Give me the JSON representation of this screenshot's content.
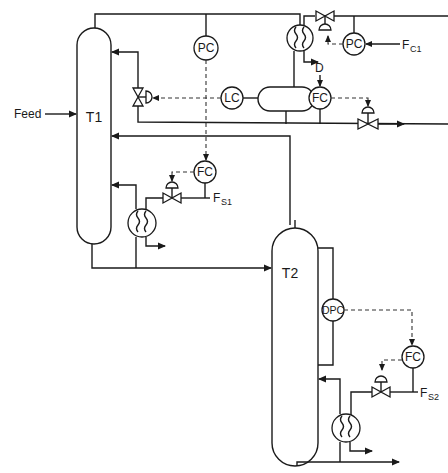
{
  "diagram": {
    "type": "process-control-flowsheet",
    "columns": [
      {
        "id": "T1",
        "label": "T1"
      },
      {
        "id": "T2",
        "label": "T2"
      }
    ],
    "streams": {
      "feed": "Feed",
      "distillate": "D",
      "coolant_1_main": "F",
      "coolant_1_sub": "C1",
      "steam_1_main": "F",
      "steam_1_sub": "S1",
      "steam_2_main": "F",
      "steam_2_sub": "S2"
    },
    "controllers": {
      "pc_column": "PC",
      "pc_condenser": "PC",
      "lc_drum": "LC",
      "fc_distillate": "FC",
      "fc_reboiler1": "FC",
      "dpc_column2": "DPC",
      "fc_reboiler2": "FC"
    },
    "equipment": [
      "column-T1",
      "column-T2",
      "condenser",
      "reflux-drum",
      "reboiler-T1",
      "reboiler-T2",
      "reflux-valve",
      "coolant-valve",
      "distillate-valve",
      "steam-valve-1",
      "steam-valve-2"
    ],
    "colors": {
      "line": "#1a1a1a",
      "background": "#ffffff"
    }
  }
}
